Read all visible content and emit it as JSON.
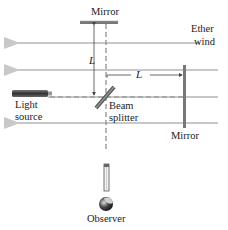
{
  "diagram": {
    "labels": {
      "top_mirror": "Mirror",
      "ether_wind_line1": "Ether",
      "ether_wind_line2": "wind",
      "length_vertical": "L",
      "length_horizontal": "L",
      "light_source_line1": "Light",
      "light_source_line2": "source",
      "beam_splitter_line1": "Beam",
      "beam_splitter_line2": "splitter",
      "right_mirror": "Mirror",
      "observer": "Observer"
    },
    "colors": {
      "ether_wind_lines": "#c8c8c8",
      "beam_dashed": "#888888",
      "mirror": "#666666",
      "light_source": "#555555",
      "text": "#222222"
    },
    "ether_wind_arrows_y": [
      43,
      70,
      97,
      123
    ]
  }
}
